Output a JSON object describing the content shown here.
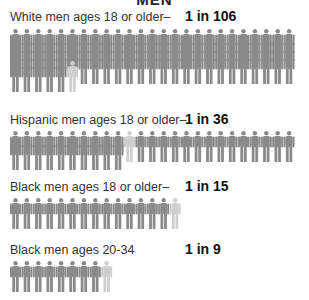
{
  "heading": "MEN",
  "colors": {
    "figure": "#8a8a8a",
    "highlight": "#cfcfcf",
    "head_detail": "#a9a9a9"
  },
  "groups": [
    {
      "label": "White men ages 18 or older–",
      "ratio": "1 in 106",
      "count": 106,
      "highlight_index": 5
    },
    {
      "label": "Hispanic men ages 18 or older–",
      "ratio": "1 in 36",
      "count": 36,
      "highlight_index": 10
    },
    {
      "label": "Black men ages 18 or older–",
      "ratio": "1 in 15",
      "count": 15,
      "highlight_index": 14
    },
    {
      "label": "Black men ages 20-34",
      "ratio": "1 in 9",
      "count": 9,
      "highlight_index": 8
    }
  ],
  "chart_data": {
    "type": "pictograph",
    "title": "MEN",
    "categories": [
      "White men ages 18 or older",
      "Hispanic men ages 18 or older",
      "Black men ages 18 or older",
      "Black men ages 20-34"
    ],
    "values": [
      "1 in 106",
      "1 in 36",
      "1 in 15",
      "1 in 9"
    ],
    "denominators": [
      106,
      36,
      15,
      9
    ],
    "legend": "Each figure = one man; highlighted figure = one incarcerated"
  }
}
